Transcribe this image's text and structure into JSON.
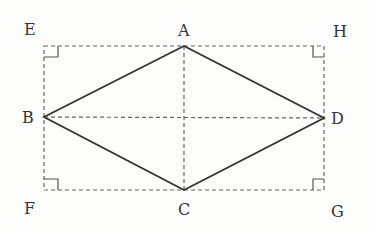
{
  "diagram": {
    "type": "rhombus inscribed in rectangle",
    "labels": {
      "A": "A",
      "B": "B",
      "C": "C",
      "D": "D",
      "E": "E",
      "F": "F",
      "G": "G",
      "H": "H"
    },
    "points": {
      "A": [
        184,
        46
      ],
      "B": [
        44,
        117
      ],
      "C": [
        184,
        190
      ],
      "D": [
        324,
        118
      ],
      "E": [
        44,
        46
      ],
      "F": [
        44,
        190
      ],
      "G": [
        324,
        190
      ],
      "H": [
        324,
        46
      ]
    },
    "solid_edges": [
      "AB",
      "BC",
      "CD",
      "DA"
    ],
    "dashed_edges": [
      "EH",
      "HG",
      "GF",
      "FE",
      "AC",
      "BD"
    ],
    "right_angle_marks": [
      "E",
      "F",
      "G",
      "H"
    ],
    "colors": {
      "line": "#333333",
      "dashed": "#666666",
      "background": "#fdfdfb"
    }
  }
}
